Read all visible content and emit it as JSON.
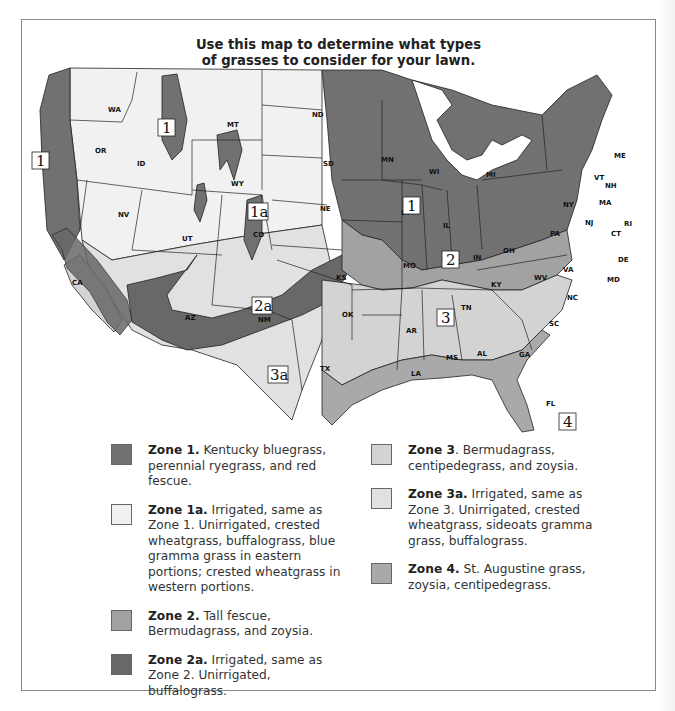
{
  "title": {
    "line1": "Use this map to determine what types",
    "line2": "of grasses to consider for your lawn."
  },
  "colors": {
    "zone1": "#717171",
    "zone1a": "#f1f1f1",
    "zone2": "#a2a2a2",
    "zone2a": "#686868",
    "zone3": "#d3d3d3",
    "zone3a": "#e1e1e1",
    "zone4": "#a9a9a9",
    "border": "#222222",
    "frame": "#8a8a8a"
  },
  "map": {
    "zone_labels": [
      {
        "id": "1",
        "text": "1"
      },
      {
        "id": "1-west",
        "text": "1"
      },
      {
        "id": "1a",
        "text": "1a"
      },
      {
        "id": "1-midwest",
        "text": "1"
      },
      {
        "id": "2",
        "text": "2"
      },
      {
        "id": "2a",
        "text": "2a"
      },
      {
        "id": "3",
        "text": "3"
      },
      {
        "id": "3a",
        "text": "3a"
      },
      {
        "id": "4",
        "text": "4"
      }
    ],
    "states": {
      "WA": "WA",
      "OR": "OR",
      "CA": "CA",
      "ID": "ID",
      "NV": "NV",
      "MT": "MT",
      "WY": "WY",
      "UT": "UT",
      "AZ": "AZ",
      "CO": "CO",
      "NM": "NM",
      "ND": "ND",
      "SD": "SD",
      "NE": "NE",
      "KS": "KS",
      "OK": "OK",
      "TX": "TX",
      "MN": "MN",
      "IA": "IA",
      "MO": "MO",
      "AR": "AR",
      "LA": "LA",
      "WI": "WI",
      "IL": "IL",
      "MI": "MI",
      "IN": "IN",
      "OH": "OH",
      "KY": "KY",
      "TN": "TN",
      "MS": "MS",
      "AL": "AL",
      "GA": "GA",
      "FL": "FL",
      "SC": "SC",
      "NC": "NC",
      "VA": "VA",
      "WV": "WV",
      "PA": "PA",
      "NY": "NY",
      "VT": "VT",
      "NH": "NH",
      "ME": "ME",
      "MA": "MA",
      "RI": "RI",
      "CT": "CT",
      "NJ": "NJ",
      "DE": "DE",
      "MD": "MD"
    }
  },
  "legend": {
    "left": [
      {
        "zone": "Zone 1.",
        "text": " Kentucky bluegrass, perennial ryegrass, and red fescue.",
        "color_key": "zone1"
      },
      {
        "zone": "Zone 1a.",
        "text": " Irrigated, same as Zone 1. Unirrigated, crested wheatgrass, buffalograss, blue gramma grass in eastern portions; crested wheatgrass in western portions.",
        "color_key": "zone1a"
      },
      {
        "zone": "Zone 2.",
        "text": " Tall fescue, Bermudagrass, and zoysia.",
        "color_key": "zone2"
      },
      {
        "zone": "Zone 2a.",
        "text": " Irrigated, same as Zone 2. Unirrigated, buffalograss.",
        "color_key": "zone2a"
      }
    ],
    "right": [
      {
        "zone": "Zone 3",
        "text": ". Bermudagrass, centipedegrass, and zoysia.",
        "color_key": "zone3"
      },
      {
        "zone": "Zone 3a.",
        "text": " Irrigated, same as Zone 3. Unirrigated, crested wheatgrass, sideoats gramma grass, buffalograss.",
        "color_key": "zone3a"
      },
      {
        "zone": "Zone 4.",
        "text": " St. Augustine grass, zoysia, centipedegrass.",
        "color_key": "zone4"
      }
    ]
  }
}
